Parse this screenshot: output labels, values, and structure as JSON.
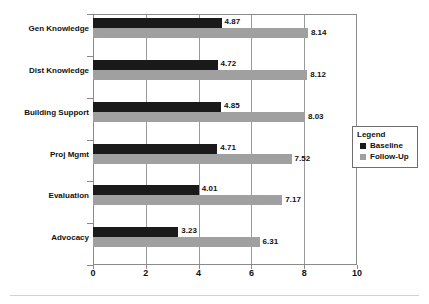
{
  "chart_data": {
    "type": "bar",
    "orientation": "horizontal",
    "title": "",
    "xlabel": "",
    "ylabel": "",
    "xlim": [
      0,
      10
    ],
    "xticks": [
      "0",
      "2",
      "4",
      "6",
      "8",
      "10"
    ],
    "grid": true,
    "legend": {
      "title": "Legend",
      "position": "right",
      "entries": [
        {
          "name": "Baseline",
          "color": "#1a1a1a"
        },
        {
          "name": "Follow-Up",
          "color": "#a0a0a0"
        }
      ]
    },
    "categories": [
      "Gen Knowledge",
      "Dist Knowledge",
      "Building Support",
      "Proj Mgmt",
      "Evaluation",
      "Advocacy"
    ],
    "series": [
      {
        "name": "Baseline",
        "color": "#1a1a1a",
        "values": [
          4.87,
          4.72,
          4.85,
          4.71,
          4.01,
          3.23
        ],
        "labels": [
          "4.87",
          "4.72",
          "4.85",
          "4.71",
          "4.01",
          "3.23"
        ]
      },
      {
        "name": "Follow-Up",
        "color": "#a0a0a0",
        "values": [
          8.14,
          8.12,
          8.03,
          7.52,
          7.17,
          6.31
        ],
        "labels": [
          "8.14",
          "8.12",
          "8.03",
          "7.52",
          "7.17",
          "6.31"
        ]
      }
    ]
  }
}
